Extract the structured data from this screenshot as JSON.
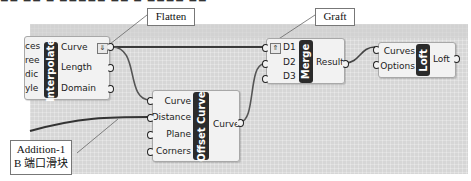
{
  "callouts": {
    "flatten": "Flatten",
    "graft": "Graft",
    "addition_line1": "Addition-1",
    "addition_line2": "B 端口滑块"
  },
  "interpolate": {
    "name": "Interpolate",
    "inputs_clipped": [
      "ces",
      "ree",
      "dic",
      "yle"
    ],
    "outputs": [
      "Curve",
      "Length",
      "Domain"
    ],
    "modifier": "Flatten"
  },
  "offset_curve": {
    "name": "Offset Curve",
    "inputs": [
      "Curve",
      "Distance",
      "Plane",
      "Corners"
    ],
    "outputs": [
      "Curve"
    ]
  },
  "merge": {
    "name": "Merge",
    "inputs": [
      "D1",
      "D2",
      "D3"
    ],
    "outputs": [
      "Result"
    ],
    "modifier": "Graft"
  },
  "loft": {
    "name": "Loft",
    "inputs": [
      "Curves",
      "Options"
    ],
    "outputs": [
      "Loft"
    ]
  },
  "colors": {
    "canvas": "#d6d6d6",
    "component": "#f2f2f2",
    "nickname_bg": "#2b2b2b",
    "wire": "#4a4a4a"
  }
}
